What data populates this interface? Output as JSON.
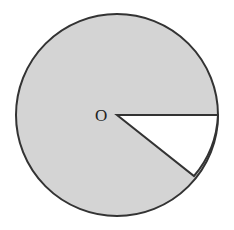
{
  "diagram": {
    "type": "circle-with-sector",
    "center_label": "O",
    "circle": {
      "cx": 117,
      "cy": 115,
      "r": 101,
      "fill": "#d4d4d4",
      "stroke": "#333333"
    },
    "sector": {
      "fill": "#ffffff",
      "start_angle_deg": 0,
      "end_angle_deg": -33,
      "stroke": "#333333"
    }
  }
}
